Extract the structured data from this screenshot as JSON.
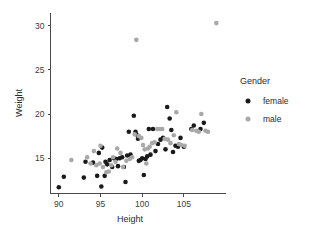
{
  "chart_data": {
    "type": "scatter",
    "title": "",
    "xlabel": "Height",
    "ylabel": "Weight",
    "xlim": [
      89.0,
      110.0
    ],
    "ylim": [
      11.0,
      31.5
    ],
    "xticks": [
      90,
      95,
      100,
      105
    ],
    "yticks": [
      15,
      20,
      25,
      30
    ],
    "xtick_labels": [
      "90",
      "95",
      "100",
      "105"
    ],
    "ytick_labels": [
      "15",
      "20",
      "25",
      "30"
    ],
    "grid": false,
    "legend": {
      "title": "Gender",
      "position": "right",
      "entries": [
        {
          "label": "female",
          "color": "#1a1a1a"
        },
        {
          "label": "male",
          "color": "#a8a8a8"
        }
      ]
    },
    "series": [
      {
        "name": "female",
        "color": "#1a1a1a",
        "points": [
          [
            90.0,
            11.7
          ],
          [
            90.6,
            12.9
          ],
          [
            93.0,
            12.8
          ],
          [
            93.2,
            14.6
          ],
          [
            94.1,
            14.5
          ],
          [
            94.6,
            13.0
          ],
          [
            94.8,
            15.6
          ],
          [
            95.1,
            11.8
          ],
          [
            95.2,
            16.2
          ],
          [
            95.5,
            13.0
          ],
          [
            95.6,
            14.6
          ],
          [
            95.8,
            14.3
          ],
          [
            96.1,
            14.8
          ],
          [
            96.4,
            14.0
          ],
          [
            96.6,
            15.0
          ],
          [
            96.9,
            14.9
          ],
          [
            97.1,
            14.1
          ],
          [
            97.3,
            15.0
          ],
          [
            97.6,
            15.1
          ],
          [
            97.8,
            14.0
          ],
          [
            98.0,
            12.3
          ],
          [
            98.2,
            15.3
          ],
          [
            98.4,
            18.0
          ],
          [
            98.6,
            15.4
          ],
          [
            99.0,
            19.8
          ],
          [
            99.2,
            18.0
          ],
          [
            99.3,
            17.7
          ],
          [
            99.5,
            17.2
          ],
          [
            99.6,
            14.7
          ],
          [
            99.8,
            14.8
          ],
          [
            100.0,
            15.0
          ],
          [
            100.2,
            13.1
          ],
          [
            100.4,
            14.9
          ],
          [
            100.6,
            15.2
          ],
          [
            100.8,
            18.3
          ],
          [
            101.0,
            15.4
          ],
          [
            101.3,
            18.3
          ],
          [
            101.6,
            15.8
          ],
          [
            101.9,
            16.6
          ],
          [
            102.2,
            17.1
          ],
          [
            102.5,
            17.3
          ],
          [
            102.8,
            16.0
          ],
          [
            103.0,
            20.8
          ],
          [
            103.3,
            19.5
          ],
          [
            103.5,
            18.2
          ],
          [
            103.7,
            15.7
          ],
          [
            104.0,
            16.4
          ],
          [
            104.3,
            16.3
          ],
          [
            104.6,
            17.3
          ],
          [
            105.0,
            16.3
          ],
          [
            105.9,
            18.3
          ],
          [
            106.2,
            18.7
          ],
          [
            107.0,
            18.3
          ],
          [
            107.4,
            19.0
          ]
        ]
      },
      {
        "name": "male",
        "color": "#a8a8a8",
        "points": [
          [
            91.5,
            14.8
          ],
          [
            93.4,
            15.1
          ],
          [
            93.8,
            14.4
          ],
          [
            94.2,
            15.8
          ],
          [
            94.5,
            14.2
          ],
          [
            94.9,
            14.4
          ],
          [
            95.0,
            16.4
          ],
          [
            95.3,
            14.0
          ],
          [
            95.7,
            13.4
          ],
          [
            96.0,
            13.5
          ],
          [
            96.3,
            14.2
          ],
          [
            96.5,
            15.1
          ],
          [
            96.8,
            14.6
          ],
          [
            97.0,
            16.1
          ],
          [
            97.4,
            15.6
          ],
          [
            97.7,
            14.0
          ],
          [
            98.1,
            14.7
          ],
          [
            98.5,
            14.9
          ],
          [
            98.8,
            15.1
          ],
          [
            99.1,
            17.7
          ],
          [
            99.3,
            28.4
          ],
          [
            99.6,
            17.5
          ],
          [
            99.9,
            17.3
          ],
          [
            100.1,
            16.5
          ],
          [
            100.3,
            16.0
          ],
          [
            100.5,
            14.4
          ],
          [
            100.7,
            16.1
          ],
          [
            100.9,
            16.3
          ],
          [
            101.2,
            16.7
          ],
          [
            101.5,
            16.8
          ],
          [
            101.8,
            18.3
          ],
          [
            102.1,
            18.3
          ],
          [
            102.4,
            18.3
          ],
          [
            102.7,
            17.2
          ],
          [
            103.1,
            17.1
          ],
          [
            103.4,
            16.7
          ],
          [
            103.8,
            17.6
          ],
          [
            104.1,
            20.2
          ],
          [
            104.4,
            16.6
          ],
          [
            104.7,
            16.5
          ],
          [
            105.1,
            16.4
          ],
          [
            106.0,
            18.2
          ],
          [
            106.5,
            18.1
          ],
          [
            106.8,
            18.0
          ],
          [
            107.1,
            20.0
          ],
          [
            107.6,
            18.1
          ],
          [
            107.9,
            18.0
          ],
          [
            108.9,
            30.3
          ]
        ]
      }
    ]
  }
}
